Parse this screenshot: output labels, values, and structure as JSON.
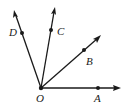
{
  "diagram": {
    "type": "rays-from-common-vertex",
    "vertex": {
      "label": "O"
    },
    "rays": [
      {
        "id": "OA",
        "point_label": "A"
      },
      {
        "id": "OB",
        "point_label": "B"
      },
      {
        "id": "OC",
        "point_label": "C"
      },
      {
        "id": "OD",
        "point_label": "D"
      }
    ],
    "colors": {
      "stroke": "#1a1a1a",
      "background": "#ffffff"
    }
  }
}
